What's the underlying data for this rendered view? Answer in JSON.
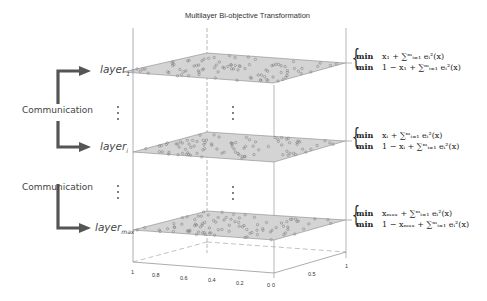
{
  "title": "Multilayer Bi-objective Transformation",
  "layers": [
    {
      "name": "layer",
      "sub": "1",
      "obj1": "x₁ + ∑ᵐᵢ₌₁ eᵢ²(x)",
      "obj2": "1 − x₁ + ∑ᵐᵢ₌₁ eᵢ²(x)"
    },
    {
      "name": "layer",
      "sub": "i",
      "obj1": "xᵢ + ∑ᵐᵢ₌₁ eᵢ²(x)",
      "obj2": "1 − xᵢ + ∑ᵐᵢ₌₁ eᵢ²(x)"
    },
    {
      "name": "layer",
      "sub": "max",
      "obj1": "xₘₐₓ + ∑ᵐᵢ₌₁ eᵢ²(x)",
      "obj2": "1 − xₘₐₓ + ∑ᵐᵢ₌₁ eᵢ²(x)"
    }
  ],
  "min_label": "min",
  "communication": [
    "Communication",
    "Communication"
  ],
  "ellipsis": "⋮",
  "axis_x_ticks": [
    "1",
    "0.8",
    "0.6",
    "0.4",
    "0.2",
    "0"
  ],
  "axis_y_ticks": [
    "0",
    "0.5",
    "1"
  ],
  "colors": {
    "plane": "#d4d4d4",
    "arrow": "#555555",
    "axis": "#888888"
  }
}
